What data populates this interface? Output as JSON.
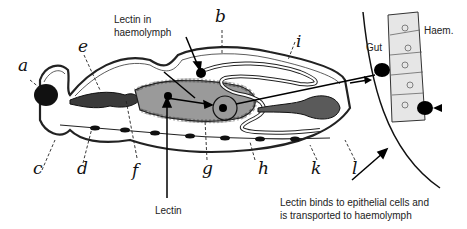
{
  "diagram": {
    "type": "insect-gut-cross-section",
    "letter_labels": [
      "a",
      "b",
      "c",
      "d",
      "e",
      "f",
      "g",
      "h",
      "i",
      "k",
      "l"
    ],
    "annotations": {
      "lectin_haemolymph": [
        "Lectin in",
        "haemolymph"
      ],
      "lectin": "Lectin",
      "gut": "Gut",
      "haem": "Haem.",
      "binds": [
        "Lectin binds to epithelial cells and",
        "is transported to haemolymph"
      ]
    },
    "colors": {
      "ink": "#111111",
      "gut_fill": "#9a9a9a",
      "dark_organ": "#3a3a3a",
      "background": "#ffffff"
    }
  }
}
